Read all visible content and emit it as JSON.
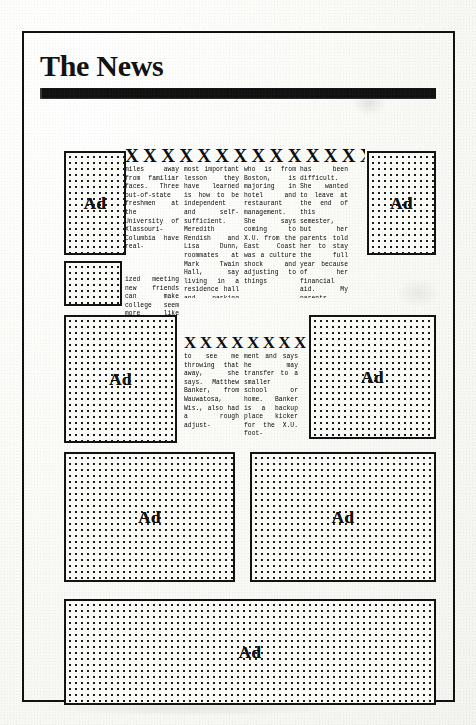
{
  "document": {
    "type": "newspaper-page-mockup",
    "masthead": {
      "title": "The News",
      "rule": "solid-black-bar"
    }
  },
  "stories": [
    {
      "id": "story-1",
      "headline": "X X X X X X X X X X X X X X X X X X X",
      "columns": [
        {
          "id": "s1c1",
          "text": "miles away from familiar faces. Three out-of-state freshmen at the University of Xlassouri-Columbia have real-"
        },
        {
          "id": "s1c2",
          "text": "most important lesson they have learned is how to be independent and self-sufficient. Meredith Rendish and Lisa Dunn, roommates at Mark Twain Hall, say living in a residence hall and parking dish,"
        },
        {
          "id": "s1c3",
          "text": "who is from Boston, is majoring in hotel and restaurant management. She says coming to X.U. from the East Coast was a culture shock and adjusting to things"
        },
        {
          "id": "s1c4",
          "text": "has been difficult. She wanted to leave at the end of this semester, but her parents told her to stay the full year because of her financial aid. My parents didn't want"
        },
        {
          "id": "s1c1b",
          "text": "ized meeting new friends can make college seem more like home. The"
        }
      ]
    },
    {
      "id": "story-2",
      "headline": "X X X X X X X X X X X",
      "columns": [
        {
          "id": "s2c1",
          "text": "to see me throwing that away, she says. Matthew Banker, from Wauwatosa, Wis., also had a rough adjust-"
        },
        {
          "id": "s2c2",
          "text": "ment and says he may transfer to a smaller school or home. Banker is a backup place kicker for the X.U. foot-"
        }
      ]
    }
  ],
  "ads": [
    {
      "id": "ad-top-left",
      "label": "Ad"
    },
    {
      "id": "ad-top-right",
      "label": "Ad"
    },
    {
      "id": "ad-mid-left",
      "label": ""
    },
    {
      "id": "ad-mid-left2",
      "label": "Ad"
    },
    {
      "id": "ad-mid-right",
      "label": "Ad"
    },
    {
      "id": "ad-low-left",
      "label": "Ad"
    },
    {
      "id": "ad-low-right",
      "label": "Ad"
    },
    {
      "id": "ad-banner",
      "label": "Ad"
    }
  ],
  "colors": {
    "ink": "#111111",
    "paper": "#fbfbf8",
    "body_text": "#2a2a2a"
  }
}
